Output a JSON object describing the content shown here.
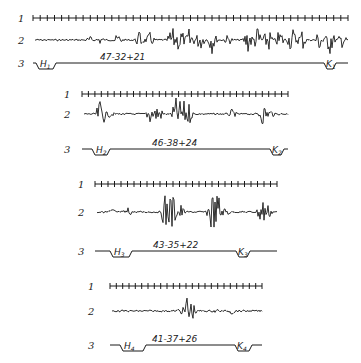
{
  "figure": {
    "row_labels": [
      "1",
      "2",
      "3"
    ],
    "panels": [
      {
        "id": 1,
        "annotation": "47-32+21",
        "start_marker": {
          "letter": "H",
          "sub": "1"
        },
        "end_marker": {
          "letter": "K",
          "sub": "1"
        },
        "geom": {
          "lx": 18,
          "x0": 33,
          "x1": 348,
          "y1": 18,
          "y2": 40,
          "y3": 63,
          "ticks": 44,
          "h_x0": 36,
          "h_x1": 56,
          "k_x0": 324,
          "k_x1": 336,
          "ann_x": 100
        },
        "bursts": [
          [
            90,
            4
          ],
          [
            100,
            5
          ],
          [
            118,
            7
          ],
          [
            140,
            10
          ],
          [
            150,
            8
          ],
          [
            172,
            14
          ],
          [
            180,
            16
          ],
          [
            190,
            14
          ],
          [
            200,
            12
          ],
          [
            212,
            14
          ],
          [
            228,
            6
          ],
          [
            248,
            14
          ],
          [
            258,
            16
          ],
          [
            268,
            14
          ],
          [
            280,
            12
          ],
          [
            292,
            15
          ],
          [
            302,
            12
          ],
          [
            320,
            14
          ],
          [
            330,
            16
          ],
          [
            342,
            8
          ]
        ]
      },
      {
        "id": 2,
        "annotation": "46-38+24",
        "start_marker": {
          "letter": "H",
          "sub": "2"
        },
        "end_marker": {
          "letter": "K",
          "sub": "2"
        },
        "geom": {
          "lx": 64,
          "x0": 82,
          "x1": 288,
          "y1": 94,
          "y2": 114,
          "y3": 149,
          "ticks": 32,
          "h_x0": 92,
          "h_x1": 110,
          "k_x0": 270,
          "k_x1": 284,
          "ann_x": 152
        },
        "bursts": [
          [
            101,
            18
          ],
          [
            110,
            4
          ],
          [
            150,
            10
          ],
          [
            158,
            12
          ],
          [
            176,
            16
          ],
          [
            182,
            20
          ],
          [
            188,
            14
          ],
          [
            232,
            5
          ],
          [
            263,
            12
          ],
          [
            270,
            6
          ]
        ]
      },
      {
        "id": 3,
        "annotation": "43-35+22",
        "start_marker": {
          "letter": "H",
          "sub": "3"
        },
        "end_marker": {
          "letter": "K",
          "sub": "3"
        },
        "geom": {
          "lx": 78,
          "x0": 95,
          "x1": 277,
          "y1": 184,
          "y2": 212,
          "y3": 251,
          "ticks": 28,
          "h_x0": 110,
          "h_x1": 132,
          "k_x0": 236,
          "k_x1": 250,
          "ann_x": 153
        },
        "bursts": [
          [
            112,
            4
          ],
          [
            128,
            5
          ],
          [
            166,
            22
          ],
          [
            172,
            24
          ],
          [
            180,
            10
          ],
          [
            212,
            24
          ],
          [
            218,
            22
          ],
          [
            226,
            6
          ],
          [
            262,
            18
          ],
          [
            268,
            8
          ]
        ]
      },
      {
        "id": 4,
        "annotation": "41-37+26",
        "start_marker": {
          "letter": "H",
          "sub": "4"
        },
        "end_marker": {
          "letter": "K",
          "sub": "4"
        },
        "geom": {
          "lx": 88,
          "x0": 110,
          "x1": 262,
          "y1": 286,
          "y2": 311,
          "y3": 345,
          "ticks": 24,
          "h_x0": 120,
          "h_x1": 146,
          "k_x0": 235,
          "k_x1": 252,
          "ann_x": 152
        },
        "bursts": [
          [
            180,
            4
          ],
          [
            188,
            22
          ],
          [
            192,
            10
          ],
          [
            216,
            3
          ],
          [
            232,
            4
          ]
        ]
      }
    ]
  }
}
